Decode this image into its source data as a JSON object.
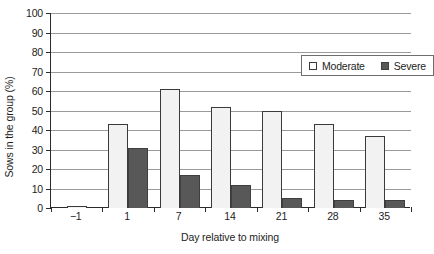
{
  "chart_data": {
    "type": "bar",
    "title": "",
    "xlabel": "Day relative to mixing",
    "ylabel": "Sows in the group (%)",
    "categories": [
      "−1",
      "1",
      "7",
      "14",
      "21",
      "28",
      "35"
    ],
    "series": [
      {
        "name": "Moderate",
        "values": [
          1,
          43,
          61,
          52,
          50,
          43,
          37
        ],
        "color": "#f2f2f2"
      },
      {
        "name": "Severe",
        "values": [
          0,
          31,
          17,
          12,
          5,
          4,
          4
        ],
        "color": "#585858"
      }
    ],
    "ylim": [
      0,
      100
    ],
    "yticks": [
      0,
      10,
      20,
      30,
      40,
      50,
      60,
      70,
      80,
      90,
      100
    ],
    "ytick_labels": [
      "0",
      "10",
      "20",
      "30",
      "40",
      "50",
      "60",
      "70",
      "80",
      "90",
      "100"
    ],
    "grid": "horizontal",
    "legend_position": "upper-right-inside",
    "legend_entries": [
      "Moderate",
      "Severe"
    ]
  }
}
